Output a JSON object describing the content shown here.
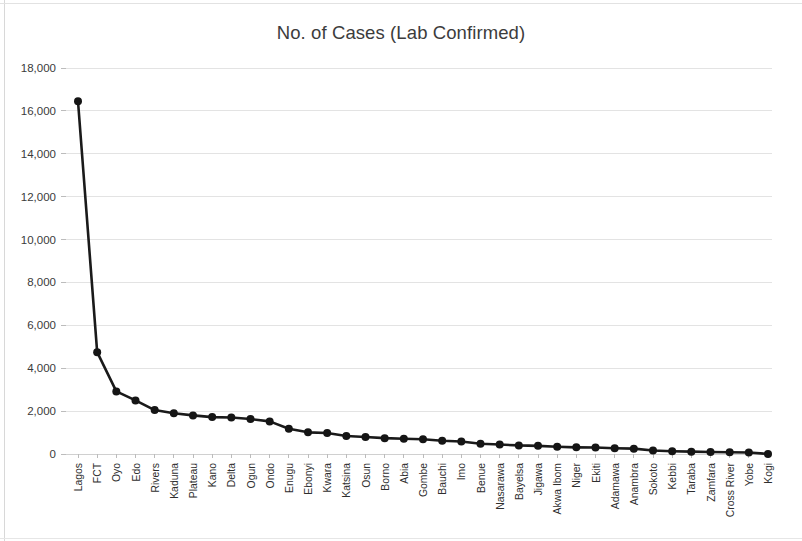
{
  "chart_data": {
    "type": "line",
    "title": "No. of Cases (Lab Confirmed)",
    "xlabel": "",
    "ylabel": "",
    "grid": true,
    "legend": false,
    "marker": "circle",
    "line_color": "#151515",
    "ylim": [
      0,
      18000
    ],
    "ytick_step": 2000,
    "ytick_labels": [
      "18,000",
      "16,000",
      "14,000",
      "12,000",
      "10,000",
      "8,000",
      "6,000",
      "4,000",
      "2,000",
      "0"
    ],
    "ytick_values": [
      18000,
      16000,
      14000,
      12000,
      10000,
      8000,
      6000,
      4000,
      2000,
      0
    ],
    "categories": [
      "Lagos",
      "FCT",
      "Oyo",
      "Edo",
      "Rivers",
      "Kaduna",
      "Plateau",
      "Kano",
      "Delta",
      "Ogun",
      "Ondo",
      "Enugu",
      "Ebonyi",
      "Kwara",
      "Katsina",
      "Osun",
      "Borno",
      "Abia",
      "Gombe",
      "Bauchi",
      "Imo",
      "Benue",
      "Nasarawa",
      "Bayelsa",
      "Jigawa",
      "Akwa Ibom",
      "Niger",
      "Ekiti",
      "Adamawa",
      "Anambra",
      "Sokoto",
      "Kebbi",
      "Taraba",
      "Zamfara",
      "Cross River",
      "Yobe",
      "Kogi"
    ],
    "values": [
      16450,
      4750,
      2920,
      2500,
      2050,
      1900,
      1800,
      1720,
      1700,
      1630,
      1520,
      1180,
      1010,
      980,
      840,
      790,
      740,
      710,
      690,
      620,
      580,
      480,
      440,
      400,
      380,
      340,
      310,
      300,
      270,
      250,
      160,
      130,
      110,
      90,
      85,
      70,
      5
    ]
  },
  "axes": {
    "y_axis_name": "y-axis",
    "x_axis_name": "x-axis"
  }
}
